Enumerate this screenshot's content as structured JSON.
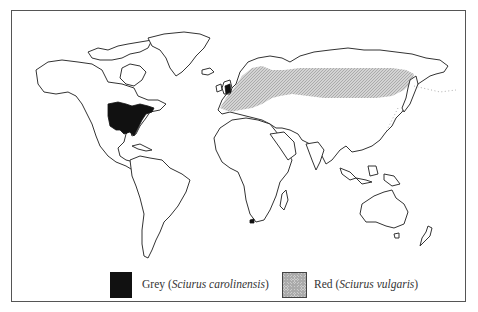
{
  "map": {
    "title": "",
    "subject": "World distribution of squirrel species",
    "projection": "world outline map",
    "regions": [
      {
        "id": "grey-squirrel-range",
        "species": "Grey",
        "area": "Eastern North America and British Isles, South Africa (Cape)",
        "fill": "#111111"
      },
      {
        "id": "red-squirrel-range",
        "species": "Red",
        "area": "Europe and northern Asia (Eurasia) to Sakhalin/Hokkaido",
        "fill": "#cccccc",
        "pattern": "hatched"
      }
    ]
  },
  "legend": {
    "items": [
      {
        "name": "Grey",
        "latin": "Sciurus carolinensis",
        "open": " (",
        "close": ")",
        "swatch_color": "#111111"
      },
      {
        "name": "Red",
        "latin": "Sciurus vulgaris",
        "open": " (",
        "close": ")",
        "swatch_color": "#cccccc"
      }
    ]
  }
}
